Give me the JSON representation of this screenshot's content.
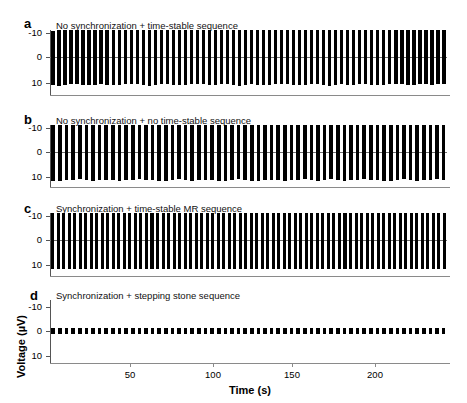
{
  "figure": {
    "axis_label_x": "Time (s)",
    "axis_label_y": "Voltage (µV)"
  },
  "panels": [
    {
      "letter": "a",
      "title": "No synchronization + time-stable sequence",
      "yticks": [
        "-10",
        "0",
        "10"
      ]
    },
    {
      "letter": "b",
      "title": "No synchronization + no time-stable sequence",
      "yticks": [
        "-10",
        "0",
        "10"
      ]
    },
    {
      "letter": "c",
      "title": "Synchronization + time-stable MR sequence",
      "yticks": [
        "-10",
        "0",
        "10"
      ]
    },
    {
      "letter": "d",
      "title": "Synchronization + stepping stone sequence",
      "yticks": [
        "-10",
        "0",
        "10"
      ]
    }
  ],
  "xticks": [
    "50",
    "100",
    "150",
    "200"
  ],
  "chart_data": {
    "type": "line",
    "title": "",
    "xlabel": "Time (s)",
    "ylabel": "Voltage (µV)",
    "xlim": [
      2,
      245
    ],
    "ylim": [
      -14,
      14
    ],
    "y_axis_inverted": true,
    "ytick_values": [
      -10,
      0,
      10
    ],
    "xtick_values": [
      50,
      100,
      150,
      200
    ],
    "grid": false,
    "legend": false,
    "series": [
      {
        "name": "No synchronization + time-stable sequence",
        "panel": "a",
        "burst_count": 66,
        "burst_period_s": 3.6,
        "envelope_top": -11.5,
        "envelope_bottom": 11.5,
        "values_top": [
          -11.0,
          -11.6,
          -11.8,
          -11.5,
          -11.2,
          -11.4,
          -11.7,
          -11.9,
          -11.6,
          -11.3,
          -11.5,
          -11.8,
          -12.0,
          -11.7,
          -11.4,
          -11.2,
          -11.5,
          -11.8,
          -11.6,
          -11.3,
          -11.1,
          -11.4,
          -11.7,
          -11.9,
          -11.6,
          -11.3,
          -11.5,
          -11.8,
          -12.0,
          -11.7,
          -11.4,
          -11.6,
          -11.9,
          -11.7,
          -11.4,
          -11.2,
          -11.5,
          -11.8,
          -11.6,
          -11.3,
          -11.5,
          -11.7,
          -12.0,
          -11.8,
          -11.5,
          -11.2,
          -11.4,
          -11.7,
          -11.9,
          -11.6,
          -11.3,
          -11.5,
          -11.8,
          -11.6,
          -11.4,
          -11.1,
          -11.3,
          -11.6,
          -11.8,
          -11.5,
          -11.2,
          -11.4,
          -11.7,
          -11.9,
          -11.6,
          -11.3
        ],
        "values_bottom": [
          11.6,
          11.9,
          11.7,
          11.4,
          11.2,
          11.5,
          11.8,
          11.6,
          11.3,
          11.5,
          11.8,
          11.6,
          11.4,
          11.1,
          11.3,
          11.6,
          11.9,
          11.7,
          11.4,
          11.2,
          11.5,
          11.8,
          11.6,
          11.3,
          11.1,
          11.4,
          11.7,
          11.5,
          11.2,
          11.4,
          11.7,
          11.9,
          11.6,
          11.3,
          11.5,
          11.8,
          11.6,
          11.4,
          11.1,
          11.3,
          11.6,
          11.8,
          11.5,
          11.2,
          11.4,
          11.7,
          11.9,
          11.6,
          11.3,
          11.5,
          11.7,
          11.4,
          11.2,
          11.5,
          11.8,
          11.6,
          11.3,
          11.1,
          11.4,
          11.7,
          11.5,
          11.2,
          11.4,
          11.6,
          11.3,
          11.1
        ]
      },
      {
        "name": "No synchronization + no time-stable sequence",
        "panel": "b",
        "burst_count": 60,
        "burst_period_s": 4.0,
        "envelope_top": -11.6,
        "envelope_bottom": 11.6,
        "values_top": [
          -11.4,
          -11.7,
          -11.9,
          -11.6,
          -11.3,
          -11.5,
          -11.8,
          -12.0,
          -11.7,
          -11.4,
          -11.2,
          -11.5,
          -11.8,
          -11.6,
          -11.3,
          -11.6,
          -11.9,
          -11.7,
          -11.4,
          -11.1,
          -11.4,
          -11.7,
          -11.9,
          -11.6,
          -11.3,
          -11.5,
          -11.8,
          -11.6,
          -11.4,
          -11.2,
          -11.5,
          -11.8,
          -12.0,
          -11.7,
          -11.4,
          -11.6,
          -11.9,
          -11.7,
          -11.5,
          -11.2,
          -11.4,
          -11.7,
          -11.9,
          -11.6,
          -11.3,
          -11.5,
          -11.8,
          -11.6,
          -11.3,
          -11.1,
          -11.4,
          -11.7,
          -11.9,
          -11.6,
          -11.4,
          -11.2,
          -11.5,
          -11.7,
          -11.5,
          -11.3
        ],
        "values_bottom": [
          11.7,
          11.9,
          11.6,
          11.4,
          11.2,
          11.5,
          11.8,
          11.6,
          11.3,
          11.5,
          11.8,
          11.6,
          11.4,
          11.1,
          11.3,
          11.6,
          11.9,
          11.7,
          11.4,
          11.2,
          11.5,
          11.8,
          11.6,
          11.3,
          11.6,
          11.9,
          11.7,
          11.4,
          11.2,
          11.4,
          11.7,
          11.9,
          11.6,
          11.3,
          11.5,
          11.8,
          11.6,
          11.4,
          11.1,
          11.4,
          11.7,
          11.5,
          11.2,
          11.5,
          11.8,
          11.6,
          11.3,
          11.1,
          11.4,
          11.6,
          11.9,
          11.7,
          11.4,
          11.2,
          11.5,
          11.7,
          11.5,
          11.3,
          11.1,
          11.4
        ]
      },
      {
        "name": "Synchronization + time-stable MR sequence",
        "panel": "c",
        "burst_count": 72,
        "burst_period_s": 3.3,
        "envelope_top": -11.8,
        "envelope_bottom": 11.8,
        "values_top": [
          -11.8,
          -11.9,
          -11.8,
          -11.7,
          -11.8,
          -11.9,
          -11.8,
          -11.7,
          -11.8,
          -11.9,
          -11.8,
          -11.8,
          -11.7,
          -11.8,
          -11.9,
          -11.8,
          -11.7,
          -11.8,
          -11.8,
          -11.9,
          -11.8,
          -11.7,
          -11.8,
          -11.9,
          -11.8,
          -11.8,
          -11.7,
          -11.8,
          -11.9,
          -11.8,
          -11.7,
          -11.8,
          -11.8,
          -11.9,
          -11.8,
          -11.7,
          -11.8,
          -11.9,
          -11.8,
          -11.8,
          -11.7,
          -11.8,
          -11.9,
          -11.8,
          -11.7,
          -11.8,
          -11.8,
          -11.9,
          -11.8,
          -11.7,
          -11.8,
          -11.9,
          -11.8,
          -11.8,
          -11.7,
          -11.8,
          -11.9,
          -11.8,
          -11.7,
          -11.8,
          -11.8,
          -11.9,
          -11.8,
          -11.7,
          -11.8,
          -11.9,
          -11.8,
          -11.8,
          -11.7,
          -11.8,
          -11.9,
          -11.8
        ],
        "values_bottom": [
          11.8,
          11.9,
          11.8,
          11.7,
          11.8,
          11.9,
          11.8,
          11.7,
          11.8,
          11.9,
          11.8,
          11.8,
          11.7,
          11.8,
          11.9,
          11.8,
          11.7,
          11.8,
          11.8,
          11.9,
          11.8,
          11.7,
          11.8,
          11.9,
          11.8,
          11.8,
          11.7,
          11.8,
          11.9,
          11.8,
          11.7,
          11.8,
          11.8,
          11.9,
          11.8,
          11.7,
          11.8,
          11.9,
          11.8,
          11.8,
          11.7,
          11.8,
          11.9,
          11.8,
          11.7,
          11.8,
          11.8,
          11.9,
          11.8,
          11.7,
          11.8,
          11.9,
          11.8,
          11.8,
          11.7,
          11.8,
          11.9,
          11.8,
          11.7,
          11.8,
          11.8,
          11.9,
          11.8,
          11.7,
          11.8,
          11.9,
          11.8,
          11.8,
          11.7,
          11.8,
          11.9,
          11.8
        ]
      },
      {
        "name": "Synchronization + stepping stone sequence",
        "panel": "d",
        "burst_count": 60,
        "burst_period_s": 4.0,
        "envelope_top": -1.3,
        "envelope_bottom": 1.3,
        "values_top": [
          -1.3,
          -1.4,
          -1.3,
          -1.2,
          -1.3,
          -1.4,
          -1.3,
          -1.2,
          -1.3,
          -1.4,
          -1.3,
          -1.3,
          -1.2,
          -1.3,
          -1.4,
          -1.3,
          -1.2,
          -1.3,
          -1.3,
          -1.4,
          -1.3,
          -1.2,
          -1.3,
          -1.4,
          -1.3,
          -1.3,
          -1.2,
          -1.3,
          -1.4,
          -1.3,
          -1.2,
          -1.3,
          -1.3,
          -1.4,
          -1.3,
          -1.2,
          -1.3,
          -1.4,
          -1.3,
          -1.3,
          -1.2,
          -1.3,
          -1.4,
          -1.3,
          -1.2,
          -1.3,
          -1.3,
          -1.4,
          -1.3,
          -1.2,
          -1.3,
          -1.4,
          -1.3,
          -1.3,
          -1.2,
          -1.3,
          -1.4,
          -1.3,
          -1.2,
          -1.3
        ],
        "values_bottom": [
          1.3,
          1.4,
          1.3,
          1.2,
          1.3,
          1.4,
          1.3,
          1.2,
          1.3,
          1.4,
          1.3,
          1.3,
          1.2,
          1.3,
          1.4,
          1.3,
          1.2,
          1.3,
          1.3,
          1.4,
          1.3,
          1.2,
          1.3,
          1.4,
          1.3,
          1.3,
          1.2,
          1.3,
          1.4,
          1.3,
          1.2,
          1.3,
          1.3,
          1.4,
          1.3,
          1.2,
          1.3,
          1.4,
          1.3,
          1.3,
          1.2,
          1.3,
          1.4,
          1.3,
          1.2,
          1.3,
          1.3,
          1.4,
          1.3,
          1.2,
          1.3,
          1.4,
          1.3,
          1.3,
          1.2,
          1.3,
          1.4,
          1.3,
          1.2,
          1.3
        ]
      }
    ]
  }
}
